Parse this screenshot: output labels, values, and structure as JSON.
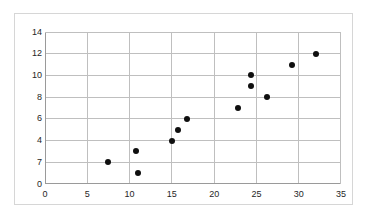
{
  "chart_data": {
    "type": "scatter",
    "title": "",
    "xlabel": "",
    "ylabel": "",
    "xlim": [
      0,
      35
    ],
    "ylim": [
      0,
      14
    ],
    "grid": true,
    "legend": "none",
    "x_ticks": [
      0,
      5,
      10,
      15,
      20,
      25,
      30,
      35
    ],
    "x_tick_labels": [
      "0",
      "5",
      "10",
      "15",
      "20",
      "25",
      "30",
      "35"
    ],
    "y_ticks": [
      0,
      2,
      4,
      6,
      8,
      10,
      12,
      14
    ],
    "y_tick_labels": [
      "0",
      "7",
      "4",
      "6",
      "8",
      "10",
      "12",
      "14"
    ],
    "series": [
      {
        "name": "",
        "marker": "filled-circle",
        "color": "#0f0f0f",
        "points": [
          {
            "x": 7.4,
            "y": 2
          },
          {
            "x": 10.8,
            "y": 3
          },
          {
            "x": 11.0,
            "y": 1
          },
          {
            "x": 15.0,
            "y": 4
          },
          {
            "x": 15.7,
            "y": 5
          },
          {
            "x": 16.8,
            "y": 6
          },
          {
            "x": 22.8,
            "y": 7
          },
          {
            "x": 24.3,
            "y": 10
          },
          {
            "x": 24.4,
            "y": 9
          },
          {
            "x": 26.2,
            "y": 8
          },
          {
            "x": 29.2,
            "y": 11
          },
          {
            "x": 32.1,
            "y": 12
          }
        ]
      }
    ]
  },
  "style": {
    "grid_color": "#bfbfbf",
    "axis_color": "#9a9a9a",
    "frame_color": "#d6d6d6",
    "point_color": "#0f0f0f",
    "background": "#ffffff",
    "tick_text_color": "#262626"
  }
}
